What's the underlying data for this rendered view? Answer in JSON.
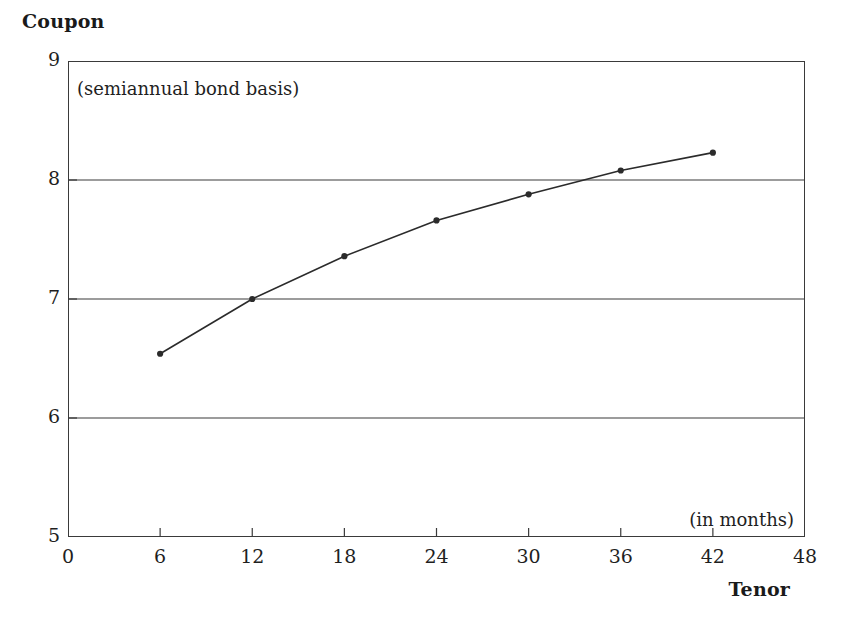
{
  "chart_data": {
    "type": "line",
    "title": "",
    "xlabel": "Tenor",
    "ylabel": "Coupon",
    "x_units_note": "(in months)",
    "y_units_note": "(semiannual bond basis)",
    "xlim": [
      0,
      48
    ],
    "ylim": [
      5,
      9
    ],
    "xticks": [
      0,
      6,
      12,
      18,
      24,
      30,
      36,
      42,
      48
    ],
    "yticks": [
      5,
      6,
      7,
      8,
      9
    ],
    "gridlines_y": [
      6,
      7,
      8
    ],
    "grid": "horizontal-only",
    "legend": "none",
    "markers": "filled-circle",
    "line_color": "#2b2b2b",
    "series": [
      {
        "name": "Coupon curve",
        "x": [
          6,
          12,
          18,
          24,
          30,
          36,
          42
        ],
        "values": [
          6.54,
          7.0,
          7.36,
          7.66,
          7.88,
          8.08,
          8.23
        ]
      }
    ]
  },
  "labels": {
    "y_axis_title": "Coupon",
    "x_axis_title": "Tenor",
    "basis_note": "(semiannual bond basis)",
    "months_note": "(in months)"
  },
  "ticks": {
    "y": [
      "9",
      "8",
      "7",
      "6",
      "5"
    ],
    "x": [
      "0",
      "6",
      "12",
      "18",
      "24",
      "30",
      "36",
      "42",
      "48"
    ]
  }
}
